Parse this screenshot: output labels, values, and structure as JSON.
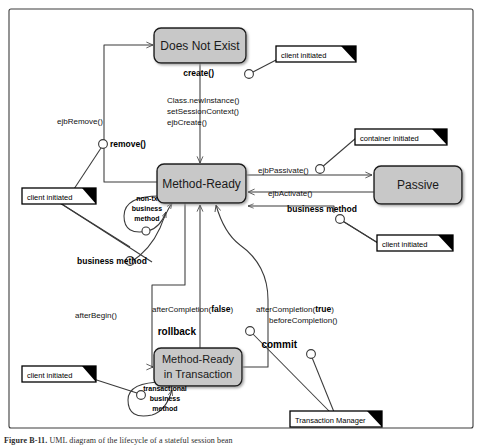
{
  "figure": {
    "border_color": "#3c3c3c",
    "background": "#ffffff",
    "state_fill": "#c8c8c8",
    "state_stroke": "#1a1a1a",
    "line_color": "#3a3a3a",
    "caption_prefix": "Figure",
    "caption_number": "B-11.",
    "caption_text": "UML diagram of the lifecycle of a stateful session bean"
  },
  "states": [
    {
      "id": "does-not-exist",
      "label": "Does Not  Exist",
      "line1": "Does Not  Exist",
      "line2": ""
    },
    {
      "id": "method-ready",
      "label": "Method-Ready",
      "line1": "Method-Ready",
      "line2": ""
    },
    {
      "id": "passive",
      "label": "Passive",
      "line1": "Passive",
      "line2": ""
    },
    {
      "id": "method-ready-in-transaction",
      "label": "Method-Ready in Transaction",
      "line1": "Method-Ready",
      "line2": "in Transaction"
    }
  ],
  "transitions": {
    "create": "create()",
    "class_newinstance": "Class.newInstance()",
    "set_session_context": "setSessionContext()",
    "ejb_create": "ejbCreate()",
    "ejb_remove": "ejbRemove()",
    "remove": "remove()",
    "ejb_passivate": "ejbPassivate()",
    "ejb_activate": "ejbActivate()",
    "business_method_right": "business method",
    "business_method_left": "business method",
    "after_begin": "afterBegin()",
    "after_completion_false": "afterCompletion(false)",
    "after_completion_false_plain": "afterCompletion(",
    "after_completion_false_bold": "false",
    "after_completion_false_tail": ")",
    "rollback": "rollback",
    "after_completion_true_plain": "afterCompletion(",
    "after_completion_true_bold": "true",
    "after_completion_true_tail": ")",
    "before_completion": "beforeCompletion()",
    "commit": "commit"
  },
  "self_loops": [
    {
      "id": "non-tx-business-method",
      "line1": "non-tx",
      "line2": "business",
      "line3": "method"
    },
    {
      "id": "transactional-business-method",
      "line1": "transactional",
      "line2": "business",
      "line3": "method"
    }
  ],
  "notes": [
    {
      "id": "note-client-initiated-create",
      "label": "client initiated"
    },
    {
      "id": "note-client-initiated-remove",
      "label": "client initiated"
    },
    {
      "id": "note-container-initiated-passivate",
      "label": "container initiated"
    },
    {
      "id": "note-client-initiated-business-method",
      "label": "client initiated"
    },
    {
      "id": "note-client-initiated-transactional",
      "label": "client initiated"
    },
    {
      "id": "note-transaction-manager",
      "label": "Transaction Manager"
    }
  ]
}
